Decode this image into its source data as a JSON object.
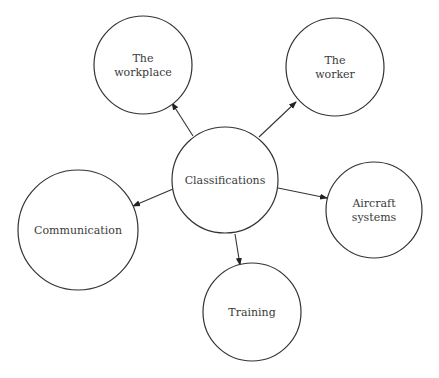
{
  "diagram": {
    "type": "concept-map",
    "center": {
      "label": "Classifications",
      "cx": 225,
      "cy": 180,
      "r": 53
    },
    "nodes": [
      {
        "id": "workplace",
        "lines": [
          "The",
          "workplace"
        ],
        "cx": 143,
        "cy": 65,
        "r": 49
      },
      {
        "id": "worker",
        "lines": [
          "The",
          "worker"
        ],
        "cx": 335,
        "cy": 67,
        "r": 49
      },
      {
        "id": "communication",
        "lines": [
          "Communication"
        ],
        "cx": 78,
        "cy": 230,
        "r": 60
      },
      {
        "id": "aircraft-systems",
        "lines": [
          "Aircraft",
          "systems"
        ],
        "cx": 374,
        "cy": 210,
        "r": 48
      },
      {
        "id": "training",
        "lines": [
          "Training"
        ],
        "cx": 252,
        "cy": 312,
        "r": 49
      }
    ],
    "edges": [
      {
        "from": "center",
        "to": "workplace",
        "x1": 193,
        "y1": 136,
        "x2": 172,
        "y2": 103
      },
      {
        "from": "center",
        "to": "worker",
        "x1": 259,
        "y1": 137,
        "x2": 296,
        "y2": 102
      },
      {
        "from": "center",
        "to": "communication",
        "x1": 173,
        "y1": 189,
        "x2": 133,
        "y2": 206
      },
      {
        "from": "center",
        "to": "aircraft-systems",
        "x1": 278,
        "y1": 188,
        "x2": 327,
        "y2": 198
      },
      {
        "from": "center",
        "to": "training",
        "x1": 235,
        "y1": 234,
        "x2": 240,
        "y2": 265
      }
    ],
    "colors": {
      "stroke": "#333333",
      "text": "#3a3a3a",
      "background": "#ffffff"
    }
  }
}
